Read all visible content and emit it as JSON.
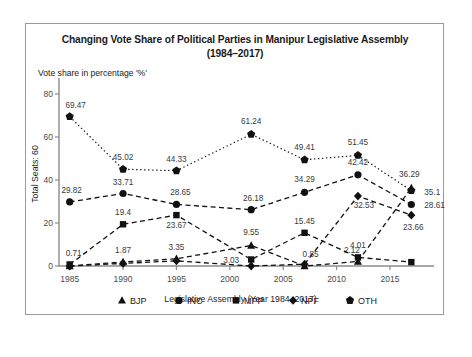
{
  "chart": {
    "title_line1": "Changing Vote Share of Political Parties in Manipur Legislative Assembly",
    "title_line2": "(1984–2017)",
    "value_axis_note": "Vote share in percentage '%'",
    "y_axis_title": "Total Seats: 60",
    "x_axis_title": "Legislative Assembly (Year 1984–2017)"
  },
  "chart_data": {
    "type": "line",
    "title": "Changing Vote Share of Political Parties in Manipur Legislative Assembly (1984–2017)",
    "subtitle": "Vote share in percentage '%'",
    "xlabel": "Legislative Assembly (Year 1984–2017)",
    "ylabel": "Total Seats: 60",
    "ylim": [
      0,
      80
    ],
    "yticks": [
      "0",
      "20",
      "40",
      "60",
      "80"
    ],
    "xlim": [
      1984,
      2018
    ],
    "xticks": [
      "1985",
      "1990",
      "1995",
      "2000",
      "2005",
      "2010",
      "2015"
    ],
    "x": [
      1985,
      1990,
      1995,
      2002,
      2007,
      2012,
      2017
    ],
    "grid": false,
    "legend_position": "bottom",
    "series": [
      {
        "name": "BJP",
        "marker": "triangle",
        "line": "dashed",
        "values": [
          0.0,
          1.87,
          3.35,
          9.55,
          0.0,
          2.12,
          36.29
        ],
        "labels": [
          "",
          "1.87",
          "3.35",
          "9.55",
          "",
          "2.12",
          "36.29"
        ]
      },
      {
        "name": "INC",
        "marker": "circle",
        "line": "dashed",
        "values": [
          29.82,
          33.71,
          28.65,
          26.18,
          34.29,
          42.42,
          28.61
        ],
        "labels": [
          "29.82",
          "33.71",
          "28.65",
          "26.18",
          "34.29",
          "42.42",
          "28.61"
        ]
      },
      {
        "name": "MPP",
        "marker": "square",
        "line": "dashed",
        "values": [
          0.71,
          19.4,
          23.67,
          3.03,
          15.45,
          4.01,
          1.8
        ],
        "labels": [
          "0.71",
          "19.4",
          "23.67",
          "3.03",
          "15.45",
          "4.01",
          ""
        ]
      },
      {
        "name": "NPF",
        "marker": "diamond",
        "line": "dashed",
        "values": [
          0.0,
          1.2,
          2.4,
          0.0,
          0.85,
          32.53,
          23.66
        ],
        "labels": [
          "",
          "",
          "",
          "",
          "0.85",
          "32.53",
          "23.66"
        ]
      },
      {
        "name": "OTH",
        "marker": "pentagon",
        "line": "dotted",
        "values": [
          69.47,
          45.02,
          44.33,
          61.24,
          49.41,
          51.45,
          35.1
        ],
        "labels": [
          "69.47",
          "45.02",
          "44.33",
          "61.24",
          "49.41",
          "51.45",
          "35.1"
        ]
      }
    ]
  },
  "legend": [
    {
      "label": "BJP",
      "marker": "triangle"
    },
    {
      "label": "INC",
      "marker": "circle"
    },
    {
      "label": "MPP",
      "marker": "square"
    },
    {
      "label": "NPF",
      "marker": "diamond"
    },
    {
      "label": "OTH",
      "marker": "pentagon"
    }
  ]
}
